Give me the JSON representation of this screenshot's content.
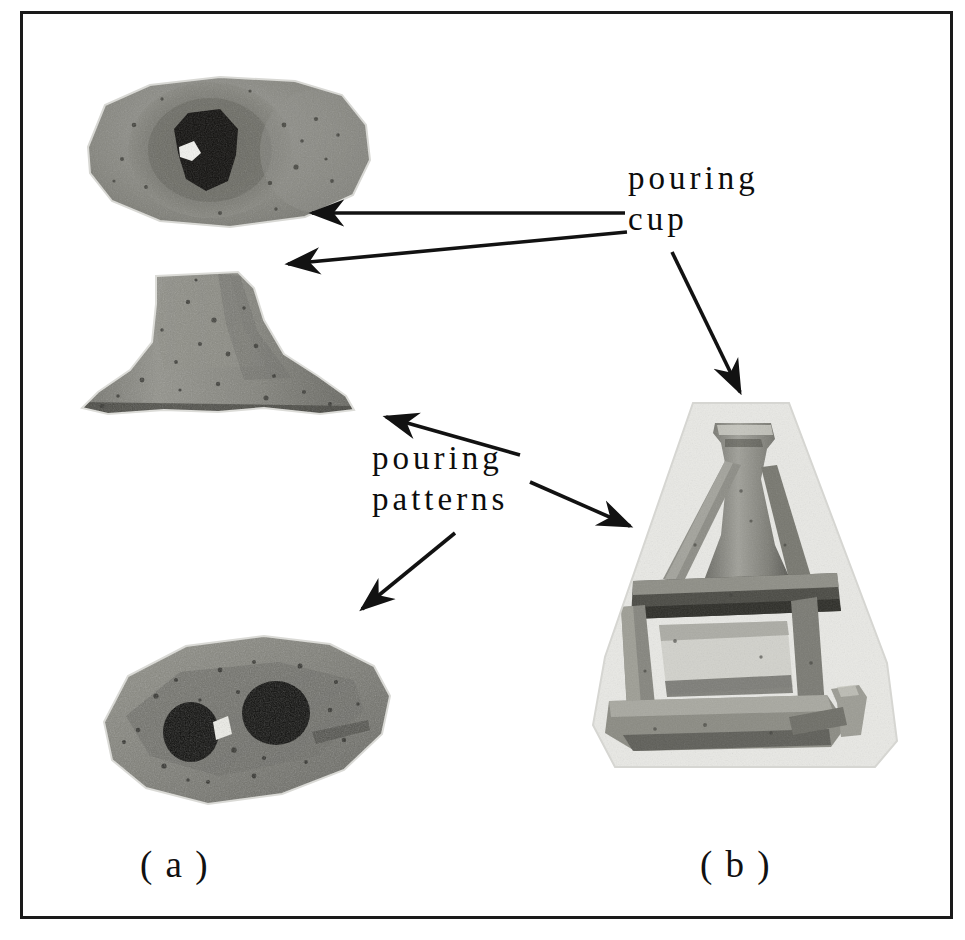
{
  "figure": {
    "type": "photograph-figure",
    "background": "#ffffff",
    "frame_color": "#1a1a1a",
    "text_color": "#0d0d0d"
  },
  "annotations": {
    "pouring_cup": "pouring\ncup",
    "pouring_patterns": "pouring\npatterns"
  },
  "captions": {
    "a": "( a )",
    "b": "( b )"
  },
  "panels": [
    {
      "id": "a",
      "caption": "( a )",
      "description": "Three separate sand-cast specimens photographed individually",
      "items": [
        {
          "name": "pouring-cup-top-view",
          "description": "Top view of a cylindrical pouring cup showing the central dark sprue opening"
        },
        {
          "name": "pouring-cup-side-view",
          "description": "Side view of the conical funnel-shaped pouring cup with flared base"
        },
        {
          "name": "pouring-pattern-plate",
          "description": "Elongated pouring pattern plate with two dark runner holes"
        }
      ]
    },
    {
      "id": "b",
      "caption": "( b )",
      "description": "Complete assembled gating system: pouring cup mounted above the horizontal pouring pattern bar with runners and ingates"
    }
  ],
  "arrows": [
    {
      "name": "arrow-cup-to-top-view",
      "from": [
        625,
        213
      ],
      "to": [
        306,
        213
      ]
    },
    {
      "name": "arrow-cup-to-side-view",
      "from": [
        627,
        232
      ],
      "to": [
        281,
        265
      ]
    },
    {
      "name": "arrow-cup-to-assembly",
      "from": [
        672,
        252
      ],
      "to": [
        742,
        396
      ]
    },
    {
      "name": "arrow-patterns-to-side-view",
      "from": [
        520,
        455
      ],
      "to": [
        380,
        414
      ]
    },
    {
      "name": "arrow-patterns-to-assembly",
      "from": [
        530,
        482
      ],
      "to": [
        634,
        528
      ]
    },
    {
      "name": "arrow-patterns-to-plate",
      "from": [
        455,
        533
      ],
      "to": [
        357,
        613
      ]
    }
  ]
}
